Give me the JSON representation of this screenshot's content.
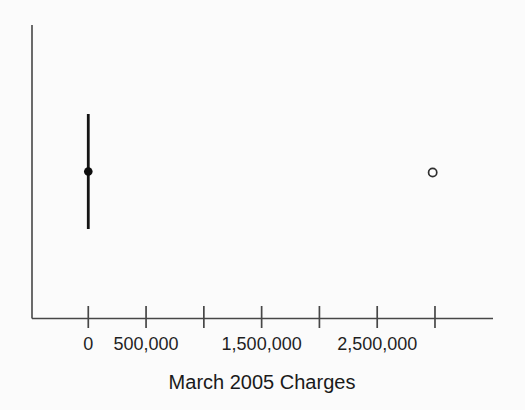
{
  "page": {
    "background_color": "#fbfbfb"
  },
  "chart_data": {
    "type": "boxplot",
    "orientation": "horizontal",
    "title": "",
    "xlabel": "March 2005 Charges",
    "ylabel": "",
    "grid": false,
    "legend": "none",
    "xlim": [
      -487000,
      3502000
    ],
    "x_ticks": [
      {
        "value": 0,
        "label": "0"
      },
      {
        "value": 500000,
        "label": "500,000"
      },
      {
        "value": 1000000,
        "label": ""
      },
      {
        "value": 1500000,
        "label": "1,500,000"
      },
      {
        "value": 2000000,
        "label": ""
      },
      {
        "value": 2500000,
        "label": "2,500,000"
      },
      {
        "value": 3000000,
        "label": ""
      }
    ],
    "series": [
      {
        "name": "March 2005 charges",
        "q1": 0,
        "median": 0,
        "q3": 0,
        "whisker_low": 0,
        "whisker_high": 0,
        "outliers": [
          2980000
        ]
      }
    ],
    "colors": {
      "axis": "#474747",
      "box": "#141414",
      "median_dot": "#0e0e0e",
      "outlier_stroke": "#2f2f2f",
      "outlier_fill": "#fdfdfd",
      "tick_text": "#1f1f1f",
      "label_text": "#1a1a1a"
    }
  }
}
